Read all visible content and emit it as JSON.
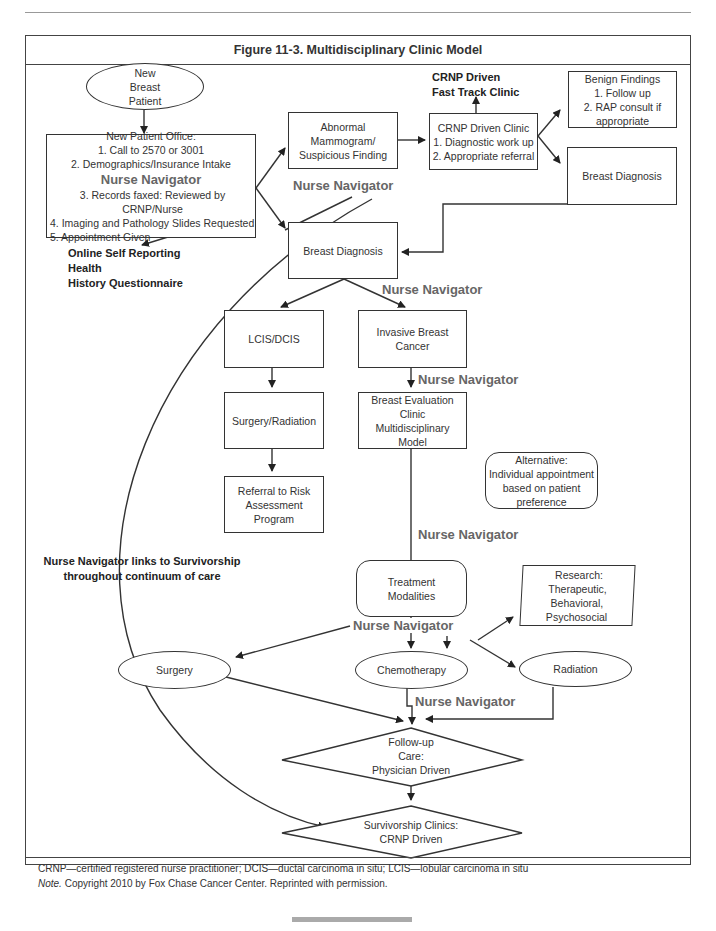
{
  "figure": {
    "title": "Figure 11-3. Multidisciplinary Clinic Model"
  },
  "nodes": {
    "new_patient": [
      "New",
      "Breast",
      "Patient"
    ],
    "new_patient_office": {
      "heading": "New Patient Office:",
      "items_before": [
        "1. Call to 2570 or 3001",
        "2. Demographics/Insurance Intake"
      ],
      "navigator": "Nurse Navigator",
      "items_after": [
        "3. Records faxed: Reviewed by CRNP/Nurse",
        "4. Imaging and Pathology Slides Requested",
        "5. Appointment Given"
      ]
    },
    "online_questionnaire": [
      "Online Self Reporting",
      "Health",
      "History Questionnaire"
    ],
    "abnormal_mammogram": [
      "Abnormal",
      "Mammogram/",
      "Suspicious Finding"
    ],
    "crnp_clinic": [
      "CRNP Driven Clinic",
      "1. Diagnostic work up",
      "2. Appropriate referral"
    ],
    "fast_track": [
      "CRNP Driven",
      "Fast Track Clinic"
    ],
    "benign_findings": [
      "Benign Findings",
      "1. Follow up",
      "2. RAP consult if",
      "appropriate"
    ],
    "breast_diagnosis_right": "Breast Diagnosis",
    "breast_diagnosis_center": "Breast Diagnosis",
    "lcis_dcis": "LCIS/DCIS",
    "invasive_cancer": [
      "Invasive Breast",
      "Cancer"
    ],
    "surgery_radiation": "Surgery/Radiation",
    "breast_eval_clinic": [
      "Breast Evaluation",
      "Clinic",
      "Multidisciplinary",
      "Model"
    ],
    "referral_risk": [
      "Referral to Risk",
      "Assessment Program"
    ],
    "alternative": [
      "Alternative:",
      "Individual appointment",
      "based on patient",
      "preference"
    ],
    "survivorship_link": [
      "Nurse Navigator links to Survivorship",
      "throughout continuum of care"
    ],
    "treatment_modalities": [
      "Treatment",
      "Modalities"
    ],
    "research": [
      "Research:",
      "Therapeutic,",
      "Behavioral,",
      "Psychosocial"
    ],
    "surgery": "Surgery",
    "chemotherapy": "Chemotherapy",
    "radiation": "Radiation",
    "follow_up": [
      "Follow-up",
      "Care:",
      "Physician Driven"
    ],
    "survivorship_clinics": [
      "Survivorship Clinics:",
      "CRNP Driven"
    ]
  },
  "navigator_labels": {
    "after_mammogram": "Nurse Navigator",
    "after_diagnosis": "Nurse Navigator",
    "after_invasive": "Nurse Navigator",
    "after_eval_clinic": "Nurse Navigator",
    "after_treatment": "Nurse Navigator",
    "after_chemo": "Nurse Navigator"
  },
  "footer": {
    "abbreviations": "CRNP—certified registered nurse practitioner; DCIS—ductal carcinoma in situ; LCIS—lobular carcinoma in situ",
    "note_label": "Note.",
    "note_text": " Copyright 2010 by Fox Chase Cancer Center. Reprinted with permission."
  },
  "colors": {
    "line": "#333333",
    "navigator_text": "#666666",
    "frame": "#444444"
  }
}
